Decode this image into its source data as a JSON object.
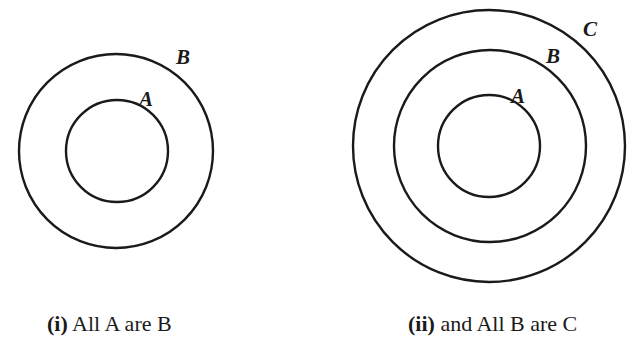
{
  "diagrams": [
    {
      "id": "i",
      "caption": {
        "number": "(i)",
        "text": " All A are B"
      },
      "sets": [
        {
          "label": "B",
          "cx": 116,
          "cy": 151,
          "r": 97,
          "label_x": 176,
          "label_y": 64
        },
        {
          "label": "A",
          "cx": 117,
          "cy": 151,
          "r": 51,
          "label_x": 139,
          "label_y": 106
        }
      ]
    },
    {
      "id": "ii",
      "caption": {
        "number": "(ii)",
        "text": " and All B are C"
      },
      "sets": [
        {
          "label": "C",
          "cx": 489,
          "cy": 146,
          "r": 136,
          "label_x": 583,
          "label_y": 36
        },
        {
          "label": "B",
          "cx": 490,
          "cy": 146,
          "r": 96,
          "label_x": 546,
          "label_y": 63
        },
        {
          "label": "A",
          "cx": 489,
          "cy": 146,
          "r": 51,
          "label_x": 511,
          "label_y": 103
        }
      ]
    }
  ],
  "colors": {
    "stroke": "#1a1a1a",
    "background": "#ffffff"
  }
}
